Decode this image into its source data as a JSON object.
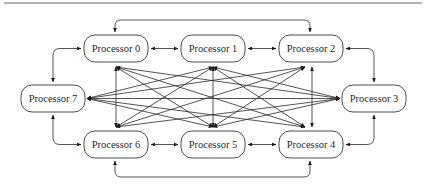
{
  "diagram": {
    "type": "fully-connected-processor-network",
    "colors": {
      "stroke": "#2a2a2a",
      "node_fill": "#ffffff",
      "text": "#2a2a2a"
    },
    "nodes": [
      {
        "id": "p0",
        "label": "Processor 0"
      },
      {
        "id": "p1",
        "label": "Processor 1"
      },
      {
        "id": "p2",
        "label": "Processor 2"
      },
      {
        "id": "p3",
        "label": "Processor 3"
      },
      {
        "id": "p4",
        "label": "Processor 4"
      },
      {
        "id": "p5",
        "label": "Processor 5"
      },
      {
        "id": "p6",
        "label": "Processor 6"
      },
      {
        "id": "p7",
        "label": "Processor 7"
      }
    ],
    "ring_links": [
      [
        "p0",
        "p1"
      ],
      [
        "p1",
        "p2"
      ],
      [
        "p2",
        "p3"
      ],
      [
        "p3",
        "p4"
      ],
      [
        "p4",
        "p5"
      ],
      [
        "p5",
        "p6"
      ],
      [
        "p6",
        "p7"
      ],
      [
        "p7",
        "p0"
      ]
    ],
    "outer_links": [
      [
        "p0",
        "p2"
      ],
      [
        "p6",
        "p4"
      ]
    ],
    "mesh_links": [
      [
        "p7",
        "p1"
      ],
      [
        "p7",
        "p2"
      ],
      [
        "p7",
        "p3"
      ],
      [
        "p7",
        "p4"
      ],
      [
        "p7",
        "p5"
      ],
      [
        "p0",
        "p6"
      ],
      [
        "p0",
        "p5"
      ],
      [
        "p0",
        "p4"
      ],
      [
        "p0",
        "p3"
      ],
      [
        "p1",
        "p6"
      ],
      [
        "p1",
        "p5"
      ],
      [
        "p1",
        "p4"
      ],
      [
        "p1",
        "p3"
      ],
      [
        "p2",
        "p6"
      ],
      [
        "p2",
        "p5"
      ],
      [
        "p2",
        "p4"
      ],
      [
        "p3",
        "p6"
      ],
      [
        "p3",
        "p5"
      ]
    ],
    "all_links_bidirectional": true
  }
}
